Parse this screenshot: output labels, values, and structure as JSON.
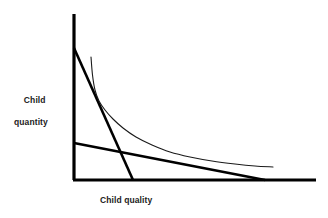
{
  "figure": {
    "y_axis_label_line1": "Child",
    "y_axis_label_line2": "quantity",
    "x_axis_label": "Child quality",
    "colors": {
      "axis": "#000000",
      "budget_line": "#000000",
      "indifference_curve": "#1a1a1a",
      "text": "#1b1b1b",
      "background": "#ffffff"
    }
  },
  "chart_data": {
    "type": "line",
    "title": "",
    "xlabel": "Child quality",
    "ylabel": "Child quantity",
    "xlim": [
      0,
      1
    ],
    "ylim": [
      0,
      1
    ],
    "grid": false,
    "legend": null,
    "axes": {
      "y_axis_x_px": 74,
      "y_axis_top_px": 14,
      "x_axis_y_px": 180,
      "x_axis_right_px": 316,
      "axis_stroke_width": 3.2
    },
    "series": [
      {
        "name": "steep-budget-line",
        "kind": "straight-line",
        "stroke_width": 2.6,
        "points": [
          [
            74,
            48
          ],
          [
            133,
            180
          ]
        ]
      },
      {
        "name": "flat-budget-line",
        "kind": "straight-line",
        "stroke_width": 2.6,
        "points": [
          [
            74,
            143
          ],
          [
            265,
            180
          ]
        ]
      },
      {
        "name": "indifference-curve",
        "kind": "convex-curve",
        "stroke_width": 1.1,
        "points": [
          [
            91,
            57
          ],
          [
            92.5,
            75
          ],
          [
            95,
            90
          ],
          [
            99,
            101
          ],
          [
            105,
            110
          ],
          [
            113,
            119
          ],
          [
            123,
            128
          ],
          [
            136,
            137
          ],
          [
            152,
            145
          ],
          [
            170,
            152
          ],
          [
            190,
            157
          ],
          [
            212,
            161
          ],
          [
            235,
            164
          ],
          [
            255,
            166
          ],
          [
            273,
            167
          ]
        ]
      }
    ],
    "annotations": []
  }
}
